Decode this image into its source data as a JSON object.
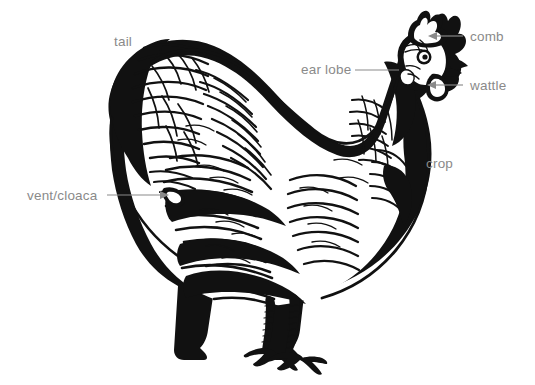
{
  "document": {
    "title": "Chicken external anatomy diagram",
    "background_color": "#ffffff",
    "ink_color": "#111111",
    "label_color": "#8a8a8a",
    "width": 535,
    "height": 385
  },
  "illustration": {
    "subject": "chicken-hen-side-view",
    "style": "pen-and-ink hatched line drawing",
    "facing": "right"
  },
  "labels": [
    {
      "id": "tail",
      "text": "tail",
      "text_x": 114,
      "text_y": 46,
      "anchor": "start",
      "leader": "none",
      "arrow": false
    },
    {
      "id": "ear-lobe",
      "text": "ear lobe",
      "text_x": 301,
      "text_y": 74,
      "anchor": "start",
      "leader": "line",
      "arrow": false,
      "line_x1": 355,
      "line_y1": 70,
      "line_x2": 399,
      "line_y2": 70
    },
    {
      "id": "comb",
      "text": "comb",
      "text_x": 470,
      "text_y": 41,
      "anchor": "start",
      "leader": "arrow",
      "arrow": true,
      "line_x1": 463,
      "line_y1": 36,
      "line_x2": 430,
      "line_y2": 36,
      "arrow_dir": "left"
    },
    {
      "id": "wattle",
      "text": "wattle",
      "text_x": 470,
      "text_y": 90,
      "anchor": "start",
      "leader": "arrow",
      "arrow": true,
      "line_x1": 463,
      "line_y1": 85,
      "line_x2": 429,
      "line_y2": 85,
      "arrow_dir": "left"
    },
    {
      "id": "crop",
      "text": "crop",
      "text_x": 426,
      "text_y": 168,
      "anchor": "start",
      "leader": "none",
      "arrow": false
    },
    {
      "id": "vent-cloaca",
      "text": "vent/cloaca",
      "text_x": 27,
      "text_y": 200,
      "anchor": "start",
      "leader": "arrow",
      "arrow": true,
      "line_x1": 107,
      "line_y1": 195,
      "line_x2": 168,
      "line_y2": 195,
      "arrow_dir": "right"
    }
  ]
}
